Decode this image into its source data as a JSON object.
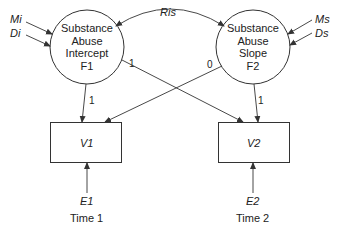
{
  "diagram": {
    "factors": [
      {
        "id": "F1",
        "lines": [
          "Substance",
          "Abuse",
          "Intercept",
          "F1"
        ]
      },
      {
        "id": "F2",
        "lines": [
          "Substance",
          "Abuse",
          "Slope",
          "F2"
        ]
      }
    ],
    "observed": [
      {
        "id": "V1",
        "label": "V1"
      },
      {
        "id": "V2",
        "label": "V2"
      }
    ],
    "errors": [
      {
        "id": "E1",
        "label": "E1",
        "time": "Time 1"
      },
      {
        "id": "E2",
        "label": "E2",
        "time": "Time 2"
      }
    ],
    "factor_inputs": {
      "F1": {
        "mean": "Mi",
        "disturbance": "Di"
      },
      "F2": {
        "mean": "Ms",
        "disturbance": "Ds"
      }
    },
    "covariance": "Ris",
    "loadings": {
      "F1_V1": "1",
      "F1_V2": "1",
      "F2_V1": "0",
      "F2_V2": "1"
    },
    "colors": {
      "stroke": "#333333",
      "text": "#222222",
      "background": "#ffffff"
    }
  }
}
